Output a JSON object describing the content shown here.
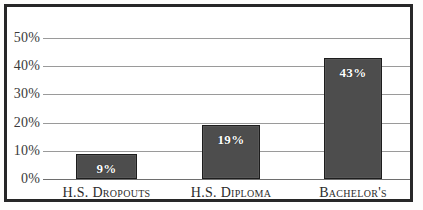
{
  "chart_data": {
    "type": "bar",
    "title": "",
    "subtitle": "",
    "xlabel": "",
    "ylabel": "",
    "categories": [
      "H.S. Dropouts",
      "H.S. Diploma",
      "Bachelor's"
    ],
    "values": [
      9,
      19,
      43
    ],
    "value_labels": [
      "9%",
      "19%",
      "43%"
    ],
    "ylim": [
      0,
      50
    ],
    "ytick_labels": [
      "0%",
      "10%",
      "20%",
      "30%",
      "40%",
      "50%"
    ],
    "ytick_values": [
      0,
      10,
      20,
      30,
      40,
      50
    ],
    "grid": true,
    "legend": "none",
    "colors": {
      "bar_fill": "#4d4d4d",
      "bar_border": "#1d1d1d",
      "gridline": "#9a9a9a",
      "frame": "#272727",
      "value_text": "#ffffff",
      "axis_text": "#3a3a3a",
      "category_text": "#2c2c2c",
      "background": "#ffffff"
    }
  }
}
